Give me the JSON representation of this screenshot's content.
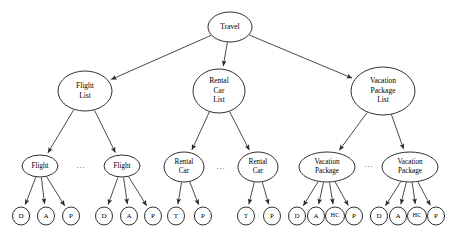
{
  "diagram": {
    "type": "tree-diagram",
    "colors": {
      "background": "#ffffff",
      "node_fill": "#ffffff",
      "node_stroke": "#1a1a1a",
      "edge_stroke": "#2b2b2b",
      "label_text": "#000000"
    },
    "nodes": [
      {
        "id": "travel",
        "lines": [
          "Travel"
        ],
        "cx": 230,
        "cy": 27,
        "rx": 22,
        "ry": 15,
        "font": 7.5
      },
      {
        "id": "flight-list",
        "lines": [
          "Flight",
          "List"
        ],
        "cx": 85,
        "cy": 91,
        "rx": 27,
        "ry": 20,
        "font": 7.5
      },
      {
        "id": "rental-car-list",
        "lines": [
          "Rental",
          "Car",
          "List"
        ],
        "cx": 219,
        "cy": 91,
        "rx": 26,
        "ry": 22,
        "font": 7.5
      },
      {
        "id": "vacation-package-list",
        "lines": [
          "Vacation",
          "Package",
          "List"
        ],
        "cx": 383,
        "cy": 91,
        "rx": 32,
        "ry": 24,
        "font": 7.5
      },
      {
        "id": "flight-1",
        "lines": [
          "Flight"
        ],
        "cx": 40,
        "cy": 166,
        "rx": 18,
        "ry": 11,
        "font": 7.2
      },
      {
        "id": "flight-2",
        "lines": [
          "Flight"
        ],
        "cx": 122,
        "cy": 166,
        "rx": 18,
        "ry": 11,
        "font": 7.2
      },
      {
        "id": "rental-car-1",
        "lines": [
          "Rental",
          "Car"
        ],
        "cx": 184,
        "cy": 167,
        "rx": 20,
        "ry": 15,
        "font": 7.2
      },
      {
        "id": "rental-car-2",
        "lines": [
          "Rental",
          "Car"
        ],
        "cx": 258,
        "cy": 167,
        "rx": 20,
        "ry": 15,
        "font": 7.2
      },
      {
        "id": "vacation-package-1",
        "lines": [
          "Vacation",
          "Package"
        ],
        "cx": 327,
        "cy": 167,
        "rx": 28,
        "ry": 15,
        "font": 7.2
      },
      {
        "id": "vacation-package-2",
        "lines": [
          "Vacation",
          "Package"
        ],
        "cx": 410,
        "cy": 167,
        "rx": 28,
        "ry": 15,
        "font": 7.2
      },
      {
        "id": "f1-d",
        "lines": [
          "D"
        ],
        "cx": 21,
        "cy": 216,
        "rx": 8.5,
        "ry": 9,
        "font": 7
      },
      {
        "id": "f1-a",
        "lines": [
          "A"
        ],
        "cx": 46,
        "cy": 216,
        "rx": 8.5,
        "ry": 9,
        "font": 7
      },
      {
        "id": "f1-p",
        "lines": [
          "P"
        ],
        "cx": 71,
        "cy": 216,
        "rx": 8.5,
        "ry": 9,
        "font": 7
      },
      {
        "id": "f2-d",
        "lines": [
          "D"
        ],
        "cx": 104,
        "cy": 216,
        "rx": 8.5,
        "ry": 9,
        "font": 7
      },
      {
        "id": "f2-a",
        "lines": [
          "A"
        ],
        "cx": 129,
        "cy": 216,
        "rx": 8.5,
        "ry": 9,
        "font": 7
      },
      {
        "id": "f2-p",
        "lines": [
          "P"
        ],
        "cx": 153,
        "cy": 216,
        "rx": 8.5,
        "ry": 9,
        "font": 7
      },
      {
        "id": "rc1-t",
        "lines": [
          "T"
        ],
        "cx": 176,
        "cy": 216,
        "rx": 8.5,
        "ry": 9,
        "font": 7
      },
      {
        "id": "rc1-p",
        "lines": [
          "P"
        ],
        "cx": 203,
        "cy": 216,
        "rx": 8.5,
        "ry": 9,
        "font": 7
      },
      {
        "id": "rc2-t",
        "lines": [
          "T"
        ],
        "cx": 246,
        "cy": 216,
        "rx": 8.5,
        "ry": 9,
        "font": 7
      },
      {
        "id": "rc2-p",
        "lines": [
          "P"
        ],
        "cx": 272,
        "cy": 216,
        "rx": 8.5,
        "ry": 9,
        "font": 7
      },
      {
        "id": "vp1-d",
        "lines": [
          "D"
        ],
        "cx": 297,
        "cy": 216,
        "rx": 8.5,
        "ry": 9,
        "font": 7
      },
      {
        "id": "vp1-a",
        "lines": [
          "A"
        ],
        "cx": 316,
        "cy": 216,
        "rx": 8.5,
        "ry": 9,
        "font": 7
      },
      {
        "id": "vp1-hc",
        "lines": [
          "HC"
        ],
        "cx": 335,
        "cy": 216,
        "rx": 9.5,
        "ry": 9,
        "font": 6.4
      },
      {
        "id": "vp1-p",
        "lines": [
          "P"
        ],
        "cx": 354,
        "cy": 216,
        "rx": 8.5,
        "ry": 9,
        "font": 7
      },
      {
        "id": "vp2-d",
        "lines": [
          "D"
        ],
        "cx": 379,
        "cy": 216,
        "rx": 8.5,
        "ry": 9,
        "font": 7
      },
      {
        "id": "vp2-a",
        "lines": [
          "A"
        ],
        "cx": 398,
        "cy": 216,
        "rx": 8.5,
        "ry": 9,
        "font": 7
      },
      {
        "id": "vp2-hc",
        "lines": [
          "HC"
        ],
        "cx": 417,
        "cy": 216,
        "rx": 9.5,
        "ry": 9,
        "font": 6.4
      },
      {
        "id": "vp2-p",
        "lines": [
          "P"
        ],
        "cx": 436,
        "cy": 216,
        "rx": 8.5,
        "ry": 9,
        "font": 7
      }
    ],
    "edges": [
      {
        "from": "travel",
        "to": "flight-list"
      },
      {
        "from": "travel",
        "to": "rental-car-list"
      },
      {
        "from": "travel",
        "to": "vacation-package-list"
      },
      {
        "from": "flight-list",
        "to": "flight-1"
      },
      {
        "from": "flight-list",
        "to": "flight-2"
      },
      {
        "from": "rental-car-list",
        "to": "rental-car-1"
      },
      {
        "from": "rental-car-list",
        "to": "rental-car-2"
      },
      {
        "from": "vacation-package-list",
        "to": "vacation-package-1"
      },
      {
        "from": "vacation-package-list",
        "to": "vacation-package-2"
      },
      {
        "from": "flight-1",
        "to": "f1-d"
      },
      {
        "from": "flight-1",
        "to": "f1-a"
      },
      {
        "from": "flight-1",
        "to": "f1-p"
      },
      {
        "from": "flight-2",
        "to": "f2-d"
      },
      {
        "from": "flight-2",
        "to": "f2-a"
      },
      {
        "from": "flight-2",
        "to": "f2-p"
      },
      {
        "from": "rental-car-1",
        "to": "rc1-t"
      },
      {
        "from": "rental-car-1",
        "to": "rc1-p"
      },
      {
        "from": "rental-car-2",
        "to": "rc2-t"
      },
      {
        "from": "rental-car-2",
        "to": "rc2-p"
      },
      {
        "from": "vacation-package-1",
        "to": "vp1-d"
      },
      {
        "from": "vacation-package-1",
        "to": "vp1-a"
      },
      {
        "from": "vacation-package-1",
        "to": "vp1-hc"
      },
      {
        "from": "vacation-package-1",
        "to": "vp1-p"
      },
      {
        "from": "vacation-package-2",
        "to": "vp2-d"
      },
      {
        "from": "vacation-package-2",
        "to": "vp2-a"
      },
      {
        "from": "vacation-package-2",
        "to": "vp2-hc"
      },
      {
        "from": "vacation-package-2",
        "to": "vp2-p"
      }
    ],
    "ellipses": [
      {
        "id": "ellipsis-flights",
        "text": "...",
        "cx": 81,
        "cy": 166,
        "font": 8
      },
      {
        "id": "ellipsis-rental-cars",
        "text": "...",
        "cx": 221,
        "cy": 167,
        "font": 8
      },
      {
        "id": "ellipsis-vacation-packages",
        "text": "...",
        "cx": 369,
        "cy": 165,
        "font": 8
      }
    ]
  }
}
